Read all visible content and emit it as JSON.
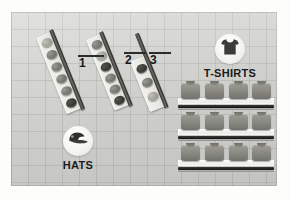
{
  "diagram": {
    "background": {
      "panel_color": "#d4d5d1",
      "grid_color": "#969896",
      "page_color": "#fdfdfc"
    },
    "callouts": [
      {
        "id": "callout-1",
        "number": "1"
      },
      {
        "id": "callout-2",
        "number": "2"
      },
      {
        "id": "callout-3",
        "number": "3"
      }
    ],
    "hat_racks": [
      {
        "id": "hat-rack-1",
        "callout": "1",
        "hat_count": 6
      },
      {
        "id": "hat-rack-2",
        "callout": "2",
        "hat_count": 6
      },
      {
        "id": "hat-rack-3",
        "callout": "3",
        "hat_count": 3
      }
    ],
    "tshirt_shelves": [
      {
        "id": "tshirt-shelf-1",
        "tshirt_count": 4
      },
      {
        "id": "tshirt-shelf-2",
        "tshirt_count": 4
      },
      {
        "id": "tshirt-shelf-3",
        "tshirt_count": 4
      }
    ],
    "badges": {
      "hats": {
        "label": "HATS",
        "icon": "baseball-cap-icon"
      },
      "tshirts": {
        "label": "T-SHIRTS",
        "icon": "t-shirt-icon"
      }
    }
  }
}
